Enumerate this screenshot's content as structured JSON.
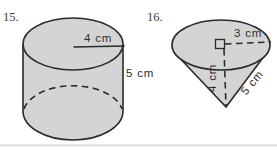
{
  "canvas": {
    "width": 277,
    "height": 151
  },
  "colors": {
    "background": "#ffffff",
    "shape_fill": "#d4d4d4",
    "outline": "#2b2b2b",
    "label_text": "#2e2e2e",
    "number_text": "#3a3a3a",
    "divider": "#d9d9d9"
  },
  "problems": [
    {
      "number": "15.",
      "shape": "cylinder",
      "radius_label": "4 cm",
      "height_label": "5 cm"
    },
    {
      "number": "16.",
      "shape": "cone",
      "radius_label": "3 cm",
      "height_label": "4 cm",
      "slant_label": "5 cm"
    }
  ]
}
